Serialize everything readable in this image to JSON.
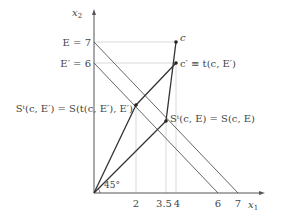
{
  "diagram": {
    "axes": {
      "x_label": "x",
      "x_sub": "1",
      "y_label": "x",
      "y_sub": "2"
    },
    "x_ticks": [
      "2",
      "3.5",
      "4",
      "6",
      "7"
    ],
    "y_labels": {
      "E": "E = 7",
      "E_prime": "E′ = 6"
    },
    "points": {
      "c": "c",
      "c_prime": "c′ ≡ t(c, E′)",
      "S_t_cE": "Sᵗ(c, E) = S(c, E)",
      "S_t_cEprime": "Sᵗ(c, E′) = S(t(c, E′), E′)"
    },
    "angle_label": "45°",
    "colors": {
      "line": "#333333",
      "budget": "#666666",
      "guide": "#cccccc"
    }
  }
}
